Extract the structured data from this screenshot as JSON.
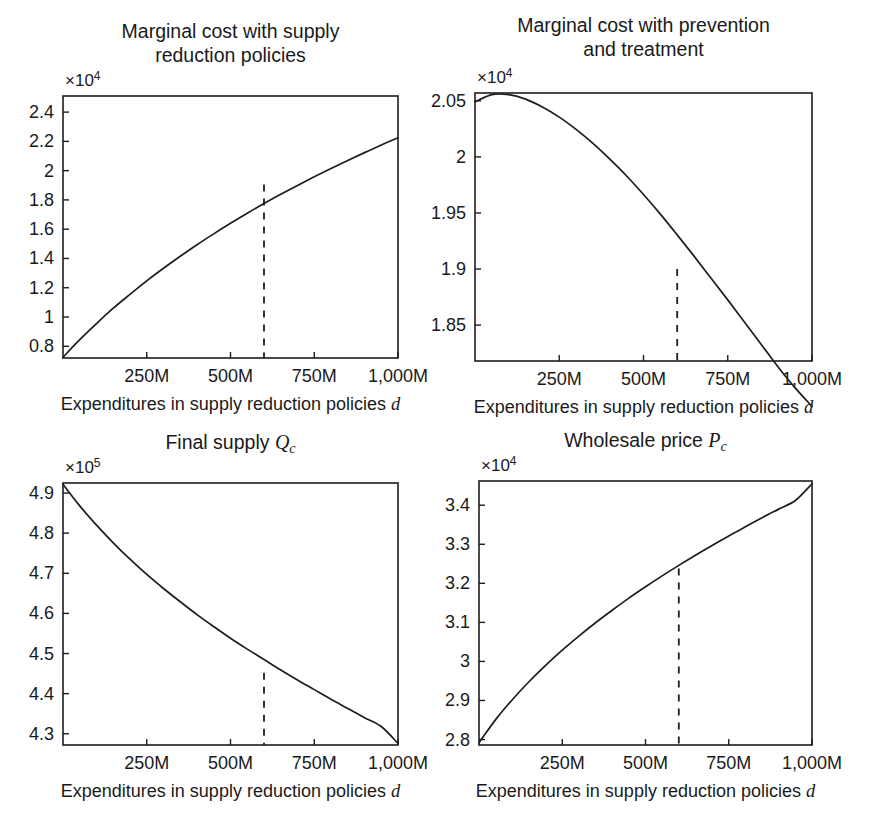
{
  "figure": {
    "background": "#ffffff",
    "line_color": "#1d1d1d",
    "panel_count": 4
  },
  "axis_title_shared": "Expenditures in supply reduction policies",
  "axis_title_var": "d",
  "x_ticks": [
    "250M",
    "500M",
    "750M",
    "1,000M"
  ],
  "chart_data": [
    {
      "id": "marginal-cost-supply-reduction",
      "type": "line",
      "title": "Marginal cost with supply reduction policies",
      "title_line1": "Marginal cost with supply",
      "title_line2": "reduction policies",
      "xlabel": "Expenditures in supply reduction policies d",
      "ylabel": "",
      "y_exponent_label": "×10",
      "y_exponent_power": "4",
      "y_scale": 10000,
      "xlim": [
        0,
        1000
      ],
      "ylim": [
        0.72,
        2.51
      ],
      "x_ticks": [
        250,
        500,
        750,
        1000
      ],
      "x_tick_labels": [
        "250M",
        "500M",
        "750M",
        "1,000M"
      ],
      "y_ticks": [
        0.8,
        1.0,
        1.2,
        1.4,
        1.6,
        1.8,
        2.0,
        2.2,
        2.4
      ],
      "y_tick_labels": [
        "0.8",
        "1",
        "1.2",
        "1.4",
        "1.6",
        "1.8",
        "2",
        "2.2",
        "2.4"
      ],
      "grid": false,
      "legend": null,
      "marker_line": {
        "x": 600,
        "y": 1.905,
        "style": "dashed",
        "from": "axis-bottom"
      },
      "x": [
        0,
        50,
        100,
        150,
        200,
        250,
        300,
        350,
        400,
        450,
        500,
        550,
        600,
        650,
        700,
        750,
        800,
        850,
        900,
        950,
        1000
      ],
      "y": [
        0.725,
        0.845,
        0.955,
        1.06,
        1.155,
        1.247,
        1.333,
        1.415,
        1.494,
        1.568,
        1.64,
        1.709,
        1.775,
        1.838,
        1.899,
        1.958,
        2.015,
        2.07,
        2.123,
        2.175,
        2.225
      ]
    },
    {
      "id": "marginal-cost-prevention-treatment",
      "type": "line",
      "title": "Marginal cost with prevention and treatment",
      "title_line1": "Marginal cost with prevention",
      "title_line2": "and treatment",
      "xlabel": "Expenditures in supply reduction policies d",
      "ylabel": "",
      "y_exponent_label": "×10",
      "y_exponent_power": "4",
      "y_scale": 10000,
      "xlim": [
        0,
        1000
      ],
      "ylim": [
        1.818,
        2.057
      ],
      "x_ticks": [
        250,
        500,
        750,
        1000
      ],
      "x_tick_labels": [
        "250M",
        "500M",
        "750M",
        "1,000M"
      ],
      "y_ticks": [
        1.85,
        1.9,
        1.95,
        2.0,
        2.05
      ],
      "y_tick_labels": [
        "1.85",
        "1.9",
        "1.95",
        "2",
        "2.05"
      ],
      "grid": false,
      "legend": null,
      "marker_line": {
        "x": 600,
        "y": 1.9,
        "style": "dashed",
        "from": "axis-bottom"
      },
      "x": [
        0,
        50,
        100,
        150,
        200,
        250,
        300,
        350,
        400,
        450,
        500,
        550,
        600,
        650,
        700,
        750,
        800,
        850,
        900,
        950,
        1000
      ],
      "y": [
        2.049,
        2.0555,
        2.0555,
        2.0515,
        2.0445,
        2.0355,
        2.0245,
        2.012,
        1.998,
        1.983,
        1.9665,
        1.949,
        1.9305,
        1.9115,
        1.892,
        1.8725,
        1.8525,
        1.8325,
        1.8125,
        1.794,
        1.7775
      ]
    },
    {
      "id": "final-supply-qc",
      "type": "line",
      "title": "Final supply Q_c",
      "title_text": "Final supply",
      "title_var": "Q",
      "title_sub": "c",
      "xlabel": "Expenditures in supply reduction policies d",
      "ylabel": "",
      "y_exponent_label": "×10",
      "y_exponent_power": "5",
      "y_scale": 100000,
      "xlim": [
        0,
        1000
      ],
      "ylim": [
        4.272,
        4.925
      ],
      "x_ticks": [
        250,
        500,
        750,
        1000
      ],
      "x_tick_labels": [
        "250M",
        "500M",
        "750M",
        "1,000M"
      ],
      "y_ticks": [
        4.3,
        4.4,
        4.5,
        4.6,
        4.7,
        4.8,
        4.9
      ],
      "y_tick_labels": [
        "4.3",
        "4.4",
        "4.5",
        "4.6",
        "4.7",
        "4.8",
        "4.9"
      ],
      "grid": false,
      "legend": null,
      "marker_line": {
        "x": 600,
        "y": 4.452,
        "style": "dashed",
        "from": "axis-bottom"
      },
      "x": [
        0,
        50,
        100,
        150,
        200,
        250,
        300,
        350,
        400,
        450,
        500,
        550,
        600,
        650,
        700,
        750,
        800,
        850,
        900,
        950,
        1000
      ],
      "y": [
        4.922,
        4.868,
        4.82,
        4.776,
        4.735,
        4.697,
        4.662,
        4.629,
        4.597,
        4.567,
        4.538,
        4.511,
        4.485,
        4.459,
        4.434,
        4.41,
        4.386,
        4.363,
        4.34,
        4.318,
        4.276
      ]
    },
    {
      "id": "wholesale-price-pc",
      "type": "line",
      "title": "Wholesale price P_c",
      "title_text": "Wholesale price",
      "title_var": "P",
      "title_sub": "c",
      "xlabel": "Expenditures in supply reduction policies d",
      "ylabel": "",
      "y_exponent_label": "×10",
      "y_exponent_power": "4",
      "y_scale": 10000,
      "xlim": [
        0,
        1000
      ],
      "ylim": [
        2.786,
        3.462
      ],
      "x_ticks": [
        250,
        500,
        750,
        1000
      ],
      "x_tick_labels": [
        "250M",
        "500M",
        "750M",
        "1,000M"
      ],
      "y_ticks": [
        2.8,
        2.9,
        3.0,
        3.1,
        3.2,
        3.3,
        3.4
      ],
      "y_tick_labels": [
        "2.8",
        "2.9",
        "3",
        "3.1",
        "3.2",
        "3.3",
        "3.4"
      ],
      "grid": false,
      "legend": null,
      "marker_line": {
        "x": 600,
        "y": 3.238,
        "style": "dashed",
        "from": "axis-bottom"
      },
      "x": [
        0,
        50,
        100,
        150,
        200,
        250,
        300,
        350,
        400,
        450,
        500,
        550,
        600,
        650,
        700,
        750,
        800,
        850,
        900,
        950,
        1000
      ],
      "y": [
        2.792,
        2.851,
        2.902,
        2.948,
        2.99,
        3.029,
        3.065,
        3.099,
        3.131,
        3.162,
        3.191,
        3.219,
        3.246,
        3.272,
        3.297,
        3.321,
        3.345,
        3.368,
        3.39,
        3.412,
        3.455
      ]
    }
  ]
}
